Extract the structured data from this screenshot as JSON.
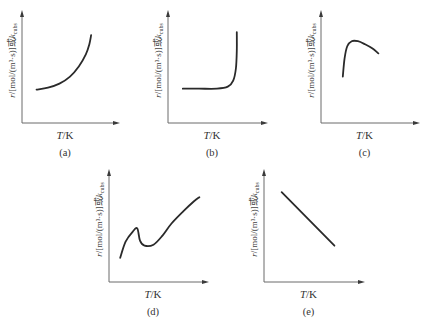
{
  "chart_data": [
    {
      "id": "a",
      "type": "line",
      "caption": "(a)",
      "xlabel": "T/K",
      "ylabel": "r/[mol/(m³·s)]或k_cubs",
      "description": "rate increases exponentially with temperature",
      "xlim": [
        0,
        1
      ],
      "ylim": [
        0,
        1
      ],
      "x": [
        0.12,
        0.25,
        0.38,
        0.5,
        0.6,
        0.68,
        0.72,
        0.74
      ],
      "y": [
        0.29,
        0.31,
        0.35,
        0.42,
        0.52,
        0.64,
        0.74,
        0.83
      ]
    },
    {
      "id": "b",
      "type": "line",
      "caption": "(b)",
      "xlabel": "T/K",
      "ylabel": "r/[mol/(m³·s)]或k_cubs",
      "description": "rate flat then explosive rise at ignition temperature",
      "xlim": [
        0,
        1
      ],
      "ylim": [
        0,
        1
      ],
      "x": [
        0.12,
        0.3,
        0.5,
        0.62,
        0.68,
        0.71,
        0.72,
        0.72
      ],
      "y": [
        0.3,
        0.3,
        0.3,
        0.32,
        0.38,
        0.5,
        0.68,
        0.86
      ]
    },
    {
      "id": "c",
      "type": "line",
      "caption": "(c)",
      "xlabel": "T/K",
      "ylabel": "r/[mol/(m³·s)]或k_cubs",
      "description": "rate rises sharply then declines (enzyme/catalytic)",
      "xlim": [
        0,
        1
      ],
      "ylim": [
        0,
        1
      ],
      "x": [
        0.2,
        0.22,
        0.25,
        0.3,
        0.37,
        0.45,
        0.53,
        0.6
      ],
      "y": [
        0.42,
        0.6,
        0.72,
        0.77,
        0.77,
        0.74,
        0.7,
        0.65
      ]
    },
    {
      "id": "d",
      "type": "line",
      "caption": "(d)",
      "xlabel": "T/K",
      "ylabel": "r/[mol/(m³·s)]或k_cubs",
      "description": "rate rises, dips, then rises again",
      "xlim": [
        0,
        1
      ],
      "ylim": [
        0,
        1
      ],
      "x": [
        0.08,
        0.14,
        0.22,
        0.27,
        0.3,
        0.35,
        0.45,
        0.55,
        0.65,
        0.78,
        0.9,
        0.96
      ],
      "y": [
        0.2,
        0.36,
        0.46,
        0.49,
        0.37,
        0.32,
        0.33,
        0.42,
        0.54,
        0.66,
        0.76,
        0.8
      ]
    },
    {
      "id": "e",
      "type": "line",
      "caption": "(e)",
      "xlabel": "T/K",
      "ylabel": "r/[mol/(m³·s)]或k_cubs",
      "description": "rate decreases linearly with temperature",
      "xlim": [
        0,
        1
      ],
      "ylim": [
        0,
        1
      ],
      "x": [
        0.15,
        0.73
      ],
      "y": [
        0.85,
        0.32
      ]
    }
  ]
}
